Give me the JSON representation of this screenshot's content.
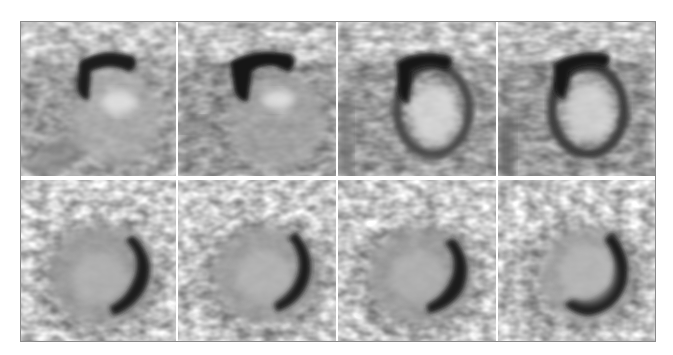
{
  "figure": {
    "layout": {
      "rows": 2,
      "columns": 4
    },
    "colormap": "grayscale-inverted",
    "frame_border_color": "#8a8a8a",
    "background_color": "#ffffff",
    "panels": [
      {
        "row": 0,
        "col": 0,
        "view": "short-axis-slice",
        "x": 0,
        "y": 0,
        "w": 155,
        "h": 154
      },
      {
        "row": 0,
        "col": 1,
        "view": "short-axis-slice",
        "x": 157,
        "y": 0,
        "w": 158,
        "h": 154
      },
      {
        "row": 0,
        "col": 2,
        "view": "short-axis-slice",
        "x": 317,
        "y": 0,
        "w": 158,
        "h": 154
      },
      {
        "row": 0,
        "col": 3,
        "view": "short-axis-slice",
        "x": 477,
        "y": 0,
        "w": 157,
        "h": 154
      },
      {
        "row": 1,
        "col": 0,
        "view": "long-axis-slice",
        "x": 0,
        "y": 158,
        "w": 155,
        "h": 161
      },
      {
        "row": 1,
        "col": 1,
        "view": "long-axis-slice",
        "x": 157,
        "y": 158,
        "w": 158,
        "h": 161
      },
      {
        "row": 1,
        "col": 2,
        "view": "long-axis-slice",
        "x": 317,
        "y": 158,
        "w": 158,
        "h": 161
      },
      {
        "row": 1,
        "col": 3,
        "view": "long-axis-slice",
        "x": 477,
        "y": 158,
        "w": 157,
        "h": 161
      }
    ]
  }
}
